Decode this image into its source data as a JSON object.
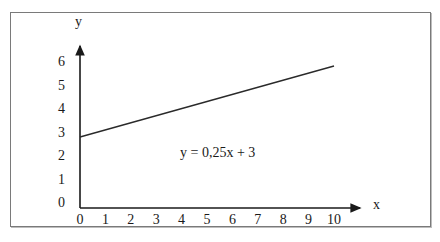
{
  "chart_data": {
    "type": "line",
    "title": "",
    "xlabel": "x",
    "ylabel": "y",
    "x_ticks": [
      "0",
      "1",
      "2",
      "3",
      "4",
      "5",
      "6",
      "7",
      "8",
      "9",
      "10"
    ],
    "y_ticks": [
      "0",
      "1",
      "2",
      "3",
      "4",
      "5",
      "6"
    ],
    "xlim": [
      0,
      10
    ],
    "ylim": [
      0,
      6
    ],
    "grid": false,
    "legend": null,
    "series": [
      {
        "name": "y = 0,25x + 3",
        "x": [
          0,
          10
        ],
        "y": [
          3,
          5.5
        ]
      }
    ],
    "annotations": [
      {
        "text": "y = 0,25x + 3",
        "x": 5.5,
        "y": 2
      }
    ]
  },
  "axes": {
    "x_label": "x",
    "y_label": "y"
  },
  "equation_label": "y = 0,25x + 3",
  "colors": {
    "axis": "#1a1a1a",
    "line": "#2a2a2a",
    "frame": "#7a7a7a"
  }
}
